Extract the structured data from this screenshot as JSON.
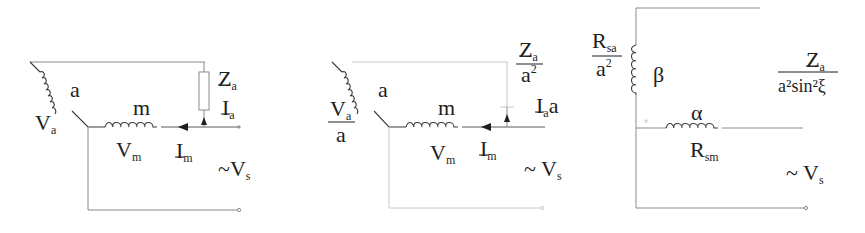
{
  "diagram": {
    "panels": [
      {
        "id": "original",
        "labels": {
          "aux_winding": "a",
          "aux_voltage": "V",
          "aux_voltage_sub": "a",
          "main_winding": "m",
          "main_voltage": "V",
          "main_voltage_sub": "m",
          "impedance": "Z",
          "impedance_sub": "a",
          "aux_current": "I",
          "aux_current_sub": "a",
          "main_current": "I",
          "main_current_sub": "m",
          "source": "~V",
          "source_sub": "s"
        }
      },
      {
        "id": "referred",
        "labels": {
          "aux_winding": "a",
          "aux_voltage_num": "V",
          "aux_voltage_num_sub": "a",
          "aux_voltage_den": "a",
          "main_winding": "m",
          "main_voltage": "V",
          "main_voltage_sub": "m",
          "impedance_num": "Z",
          "impedance_num_sub": "a",
          "impedance_den": "a",
          "impedance_den_sup": "2",
          "aux_current": "I",
          "aux_current_sub": "a",
          "aux_current_suffix": "a",
          "main_current": "I",
          "main_current_sub": "m",
          "source": "~ V",
          "source_sub": "s"
        }
      },
      {
        "id": "equivalent",
        "labels": {
          "beta_winding": "β",
          "alpha_winding": "α",
          "r_sa_num": "R",
          "r_sa_num_sub": "sa",
          "r_sa_den": "a",
          "r_sa_den_sup": "2",
          "r_sm": "R",
          "r_sm_sub": "sm",
          "impedance_num": "Z",
          "impedance_num_sub": "a",
          "impedance_den": "a²sin²ξ",
          "source": "~ V",
          "source_sub": "s"
        }
      }
    ]
  }
}
